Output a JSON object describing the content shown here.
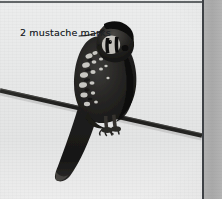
{
  "page": {
    "background_color": "#e6e6e6",
    "width": 222,
    "height": 199
  },
  "photo": {
    "name": "american-kestrel-on-wire",
    "subject": "American Kestrel perched on a wire",
    "style": "black-and-white photograph",
    "background_color": "#e7e8e8",
    "bird_color": "#1d1d1d",
    "wire_color": "#20201f"
  },
  "annotation": {
    "label": "2 mustache marks",
    "text_color": "#20242a",
    "leader_line_color": "#1c1c1c"
  },
  "layout": {
    "photo_column_width": 202,
    "column_rule_color": "#3e4145",
    "right_column_color": "#ababab"
  }
}
